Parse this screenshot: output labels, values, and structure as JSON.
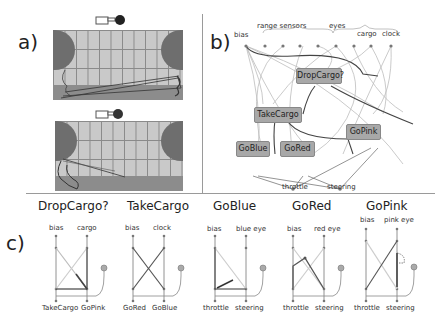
{
  "panels": {
    "a": {
      "label": "a)",
      "icons": [
        "hand-pointer-icon",
        "red-dot-icon"
      ],
      "arenas": [
        {
          "name": "top-arena",
          "grid_cols": 11,
          "grid_rows": 4
        },
        {
          "name": "bottom-arena",
          "grid_cols": 11,
          "grid_rows": 4
        }
      ]
    },
    "b": {
      "label": "b)",
      "inputs": {
        "bias": "bias",
        "range_sensors": "range sensors",
        "eyes": "eyes",
        "cargo": "cargo",
        "clock": "clock"
      },
      "modules": [
        "DropCargo?",
        "TakeCargo",
        "GoBlue",
        "GoRed",
        "GoPink"
      ],
      "outputs": {
        "throttle": "throttle",
        "steering": "steering"
      }
    },
    "c": {
      "label": "c)",
      "diagrams": [
        {
          "title": "DropCargo?",
          "in_left": "bias",
          "in_right": "cargo",
          "out_left": "TakeCargo",
          "out_right": "GoPink"
        },
        {
          "title": "TakeCargo",
          "in_left": "bias",
          "in_right": "clock",
          "out_left": "GoRed",
          "out_right": "GoBlue"
        },
        {
          "title": "GoBlue",
          "in_left": "bias",
          "in_right": "blue eye",
          "out_left": "throttle",
          "out_right": "steering"
        },
        {
          "title": "GoRed",
          "in_left": "bias",
          "in_right": "red eye",
          "out_left": "throttle",
          "out_right": "steering"
        },
        {
          "title": "GoPink",
          "in_left": "bias",
          "in_right": "pink eye",
          "out_left": "throttle",
          "out_right": "steering"
        }
      ]
    }
  },
  "colors": {
    "arena_fill": "#c9c9c9",
    "arena_grid": "#8a8a8a",
    "goal": "#6e6e6e",
    "strip": "#8c8c8c",
    "module_fill": "#a8a8a8",
    "module_dark": "#444444",
    "wire_light": "#bdbdbd"
  }
}
